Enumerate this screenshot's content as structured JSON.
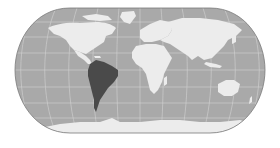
{
  "map": {
    "projection": "Eckert IV",
    "highlighted_region": "South America",
    "colors": {
      "background": "#ffffff",
      "ocean": "#a9a9a9",
      "land": "#ececec",
      "highlight": "#4a4a4a",
      "graticule": "#d8d8d8",
      "outline": "#7a7a7a"
    },
    "regions": [
      {
        "name": "North America",
        "highlighted": false
      },
      {
        "name": "Central America",
        "highlighted": false
      },
      {
        "name": "South America",
        "highlighted": true
      },
      {
        "name": "Greenland",
        "highlighted": false
      },
      {
        "name": "Europe",
        "highlighted": false
      },
      {
        "name": "Africa",
        "highlighted": false
      },
      {
        "name": "Asia",
        "highlighted": false
      },
      {
        "name": "Australia",
        "highlighted": false
      },
      {
        "name": "Antarctica",
        "highlighted": false
      }
    ]
  }
}
